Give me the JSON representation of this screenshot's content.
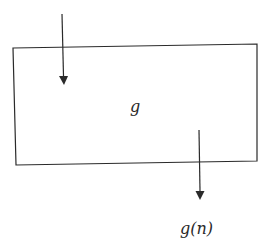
{
  "diagram": {
    "box_label": "g",
    "output_label": "g(n)",
    "stroke_color": "#2a2a2a",
    "background": "#ffffff"
  }
}
